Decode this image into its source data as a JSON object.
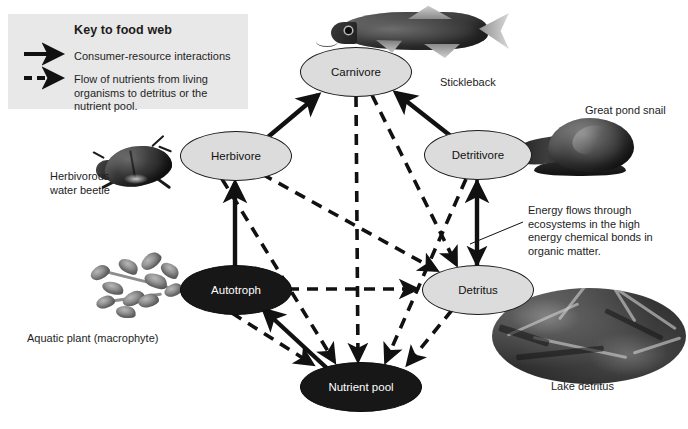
{
  "diagram": {
    "legend": {
      "title": "Key to food web",
      "solid_arrow_label": "Consumer-resource interactions",
      "dashed_arrow_label": "Flow of nutrients from living organisms to detritus or the nutrient pool.",
      "solid_icon": "solid-arrow-icon",
      "dashed_icon": "dashed-arrow-icon",
      "background_color": "#e8e8e8"
    },
    "nodes": [
      {
        "id": "carnivore",
        "label": "Carnivore",
        "style": "light",
        "fill": "#dcdcdc",
        "text_color": "#111111",
        "cx": 355,
        "cy": 71,
        "rx": 55,
        "ry": 24
      },
      {
        "id": "herbivore",
        "label": "Herbivore",
        "style": "light",
        "fill": "#dcdcdc",
        "text_color": "#111111",
        "cx": 235,
        "cy": 155,
        "rx": 55,
        "ry": 24
      },
      {
        "id": "detritivore",
        "label": "Detritivore",
        "style": "light",
        "fill": "#dcdcdc",
        "text_color": "#111111",
        "cx": 477,
        "cy": 154,
        "rx": 53,
        "ry": 24
      },
      {
        "id": "autotroph",
        "label": "Autotroph",
        "style": "dark",
        "fill": "#171717",
        "text_color": "#ffffff",
        "cx": 235,
        "cy": 289,
        "rx": 55,
        "ry": 24
      },
      {
        "id": "detritus",
        "label": "Detritus",
        "style": "light",
        "fill": "#dcdcdc",
        "text_color": "#111111",
        "cx": 477,
        "cy": 289,
        "rx": 55,
        "ry": 24
      },
      {
        "id": "nutrient_pool",
        "label": "Nutrient pool",
        "style": "dark",
        "fill": "#171717",
        "text_color": "#ffffff",
        "cx": 360,
        "cy": 386,
        "rx": 60,
        "ry": 24
      }
    ],
    "edges": [
      {
        "from": "autotroph",
        "to": "herbivore",
        "type": "solid"
      },
      {
        "from": "herbivore",
        "to": "carnivore",
        "type": "solid"
      },
      {
        "from": "detritivore",
        "to": "carnivore",
        "type": "solid"
      },
      {
        "from": "detritus",
        "to": "detritivore",
        "type": "solid"
      },
      {
        "from": "nutrient_pool",
        "to": "autotroph",
        "type": "solid"
      },
      {
        "from": "autotroph",
        "to": "detritus",
        "type": "dashed"
      },
      {
        "from": "herbivore",
        "to": "detritus",
        "type": "dashed"
      },
      {
        "from": "carnivore",
        "to": "detritus",
        "type": "dashed"
      },
      {
        "from": "detritivore",
        "to": "detritus",
        "type": "dashed"
      },
      {
        "from": "autotroph",
        "to": "nutrient_pool",
        "type": "dashed"
      },
      {
        "from": "herbivore",
        "to": "nutrient_pool",
        "type": "dashed"
      },
      {
        "from": "carnivore",
        "to": "nutrient_pool",
        "type": "dashed"
      },
      {
        "from": "detritivore",
        "to": "nutrient_pool",
        "type": "dashed"
      },
      {
        "from": "detritus",
        "to": "nutrient_pool",
        "type": "dashed"
      }
    ],
    "photo_captions": {
      "stickleback": "Stickleback",
      "great_pond_snail": "Great pond snail",
      "herbivorous_water_beetle": "Herbivorous\nwater beetle",
      "herbivorous_water_beetle_line1": "Herbivorous",
      "herbivorous_water_beetle_line2": "water beetle",
      "aquatic_plant": "Aquatic plant (macrophyte)",
      "lake_detritus": "Lake detritus"
    },
    "annotation": {
      "energy_note": "Energy flows through ecosystems in the high energy chemical bonds in organic matter."
    }
  }
}
